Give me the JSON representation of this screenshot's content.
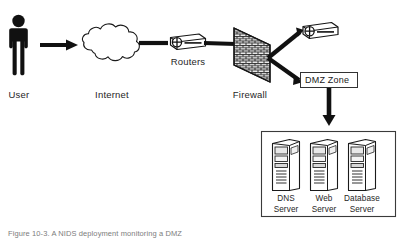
{
  "figure": {
    "caption": "Figure 10-3. A NIDS deployment monitoring a DMZ",
    "background_color": "#ffffff",
    "line_color": "#111111",
    "text_color": "#262626"
  },
  "nodes": {
    "user": {
      "label": "User",
      "icon": "person-icon"
    },
    "internet": {
      "label": "Internet",
      "icon": "cloud-icon"
    },
    "routers": {
      "label": "Routers",
      "icon": "router-icon"
    },
    "firewall": {
      "label": "Firewall",
      "icon": "brick-wall-icon"
    },
    "dmz_router": {
      "label": "",
      "icon": "router-icon"
    },
    "dmz_zone": {
      "label": "DMZ Zone",
      "icon": "zone-box-icon"
    }
  },
  "servers": {
    "box_label": "",
    "items": [
      {
        "name_line1": "DNS",
        "name_line2": "Server",
        "icon": "server-tower-icon"
      },
      {
        "name_line1": "Web",
        "name_line2": "Server",
        "icon": "server-tower-icon"
      },
      {
        "name_line1": "Database",
        "name_line2": "Server",
        "icon": "server-tower-icon"
      }
    ]
  },
  "connections": [
    {
      "from": "user",
      "to": "internet",
      "style": "thick-arrow"
    },
    {
      "from": "internet",
      "to": "routers",
      "style": "thick-line"
    },
    {
      "from": "routers",
      "to": "firewall",
      "style": "thick-line"
    },
    {
      "from": "firewall",
      "to": "dmz_router",
      "style": "thick-line"
    },
    {
      "from": "firewall",
      "to": "dmz_zone",
      "style": "thick-line"
    },
    {
      "from": "dmz_zone",
      "to": "servers",
      "style": "thick-arrow"
    }
  ]
}
